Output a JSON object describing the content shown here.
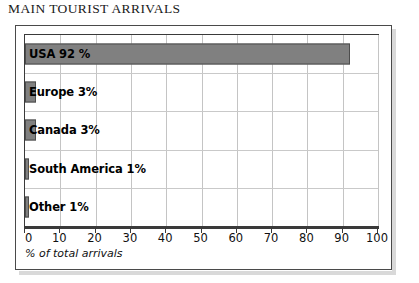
{
  "page_title": "MAIN TOURIST ARRIVALS",
  "chart_data": {
    "type": "bar",
    "orientation": "horizontal",
    "title": "MAIN TOURIST ARRIVALS",
    "xlabel": "% of total arrivals",
    "ylabel": "",
    "xlim": [
      0,
      100
    ],
    "xticks": [
      0,
      10,
      20,
      30,
      40,
      50,
      60,
      70,
      80,
      90,
      100
    ],
    "xtick_labels": [
      "0",
      "10",
      "20",
      "30",
      "40",
      "50",
      "60",
      "70",
      "80",
      "90",
      "100"
    ],
    "grid": true,
    "legend": false,
    "categories": [
      "USA",
      "Europe",
      "Canada",
      "South America",
      "Other"
    ],
    "values": [
      92,
      3,
      3,
      1,
      1
    ],
    "data_labels": [
      "USA 92 %",
      "Europe 3%",
      "Canada 3%",
      "South America 1%",
      "Other 1%"
    ],
    "bar_color": "#808080",
    "bar_border_color": "#4d4d4d",
    "grid_color": "#c4c4c4",
    "frame_color": "#3a3a3a"
  }
}
